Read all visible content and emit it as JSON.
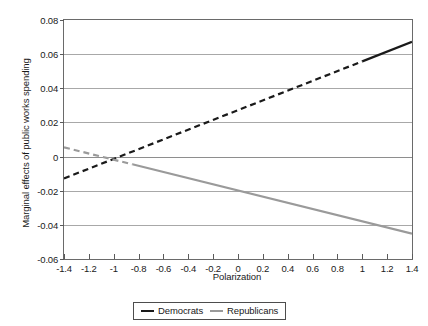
{
  "chart_data": {
    "type": "line",
    "title": "",
    "xlabel": "Polarization",
    "ylabel": "Marginal effects of public works spending",
    "xlim": [
      -1.4,
      1.4
    ],
    "ylim": [
      -0.06,
      0.08
    ],
    "xticks": [
      "-1.4",
      "-1.2",
      "-1",
      "-0.8",
      "-0.6",
      "-0.4",
      "-0.2",
      "0",
      "0.2",
      "0.4",
      "0.6",
      "0.8",
      "1",
      "1.2",
      "1.4"
    ],
    "xtick_values": [
      -1.4,
      -1.2,
      -1,
      -0.8,
      -0.6,
      -0.4,
      -0.2,
      0,
      0.2,
      0.4,
      0.6,
      0.8,
      1,
      1.2,
      1.4
    ],
    "yticks": [
      "0.08",
      "0.06",
      "0.04",
      "0.02",
      "0",
      "-0.02",
      "-0.04",
      "-0.06"
    ],
    "ytick_values": [
      0.08,
      0.06,
      0.04,
      0.02,
      0,
      -0.02,
      -0.04,
      -0.06
    ],
    "grid": "horizontal",
    "legend_position": "bottom-center",
    "series": [
      {
        "name": "Democrats",
        "color": "#1a1a1a",
        "x": [
          -1.4,
          1.4
        ],
        "values": [
          -0.0128,
          0.0672
        ],
        "slope": 0.02857,
        "intercept": 0.0272,
        "dashed_from": -1.4,
        "dashed_to": 1.0,
        "solid_from": 1.0,
        "solid_to": 1.4
      },
      {
        "name": "Republicans",
        "color": "#9a9a9a",
        "x": [
          -1.4,
          1.4
        ],
        "values": [
          0.0054,
          -0.0451
        ],
        "slope": -0.01804,
        "intercept": -0.0199,
        "dashed_from": -1.4,
        "dashed_to": -0.85,
        "solid_from": -0.85,
        "solid_to": 1.4
      }
    ],
    "annotations": []
  },
  "legend": {
    "items": [
      {
        "label": "Democrats",
        "color": "#1a1a1a"
      },
      {
        "label": "Republicans",
        "color": "#9a9a9a"
      }
    ]
  }
}
